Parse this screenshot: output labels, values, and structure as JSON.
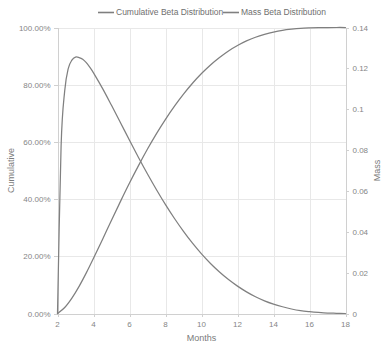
{
  "chart_data": {
    "type": "line",
    "title": "",
    "xlabel": "Months",
    "ylabel": "Cumulative",
    "y2label": "Mass",
    "xlim": [
      2,
      18
    ],
    "ylim": [
      0,
      1
    ],
    "y2lim": [
      0,
      0.14
    ],
    "grid": true,
    "legend_position": "top",
    "x_ticks": [
      2,
      4,
      6,
      8,
      10,
      12,
      14,
      16,
      18
    ],
    "x_tick_labels": [
      "2",
      "4",
      "6",
      "8",
      "10",
      "12",
      "14",
      "16",
      "18"
    ],
    "y_ticks": [
      0,
      0.2,
      0.4,
      0.6,
      0.8,
      1
    ],
    "y_tick_labels": [
      "0.00%",
      "20.00%",
      "40.00%",
      "60.00%",
      "80.00%",
      "100.00%"
    ],
    "y2_ticks": [
      0,
      0.02,
      0.04,
      0.06,
      0.08,
      0.1,
      0.12,
      0.14
    ],
    "y2_tick_labels": [
      "0",
      "0.02",
      "0.04",
      "0.06",
      "0.08",
      "0.1",
      "0.12",
      "0.14"
    ],
    "colors": {
      "cumulative": "#7f7f7f",
      "mass": "#808080",
      "grid": "#e8e8e8",
      "axis": "#d0d0d0",
      "text": "#868686"
    },
    "series": [
      {
        "name": "Cumulative Beta Distribution",
        "axis": "left",
        "color": "#7f7f7f",
        "x": [
          2,
          2.4,
          2.8,
          3.2,
          3.6,
          4,
          4.5,
          5,
          5.5,
          6,
          6.5,
          7,
          7.5,
          8,
          8.5,
          9,
          9.5,
          10,
          10.5,
          11,
          11.5,
          12,
          12.5,
          13,
          13.5,
          14,
          14.5,
          15,
          15.5,
          16,
          16.5,
          17,
          17.5,
          18
        ],
        "values": [
          0,
          0.021,
          0.054,
          0.095,
          0.142,
          0.193,
          0.259,
          0.326,
          0.392,
          0.456,
          0.517,
          0.575,
          0.629,
          0.679,
          0.725,
          0.767,
          0.805,
          0.839,
          0.869,
          0.895,
          0.918,
          0.937,
          0.953,
          0.966,
          0.976,
          0.984,
          0.99,
          0.994,
          0.997,
          0.9985,
          0.9994,
          0.9998,
          1,
          1
        ]
      },
      {
        "name": "Mass Beta Distribution",
        "axis": "right",
        "color": "#808080",
        "x": [
          2,
          2.2,
          2.4,
          2.6,
          2.8,
          3,
          3.2,
          3.4,
          3.6,
          3.8,
          4,
          4.5,
          5,
          5.5,
          6,
          6.5,
          7,
          7.5,
          8,
          8.5,
          9,
          9.5,
          10,
          10.5,
          11,
          11.5,
          12,
          12.5,
          13,
          13.5,
          14,
          14.5,
          15,
          15.5,
          16,
          16.5,
          17,
          17.5,
          18
        ],
        "values": [
          0,
          0.082,
          0.109,
          0.12,
          0.124,
          0.1255,
          0.1253,
          0.1245,
          0.1228,
          0.1205,
          0.1178,
          0.1102,
          0.1019,
          0.0934,
          0.0848,
          0.0764,
          0.0683,
          0.0606,
          0.0533,
          0.0465,
          0.0402,
          0.0344,
          0.0292,
          0.0245,
          0.0203,
          0.0166,
          0.0134,
          0.0106,
          0.0082,
          0.0062,
          0.0046,
          0.0033,
          0.0022,
          0.0014,
          0.0009,
          0.0005,
          0.0002,
          0.0001,
          0
        ]
      }
    ]
  },
  "legend": {
    "items": [
      {
        "label": "Cumulative Beta Distribution",
        "color": "#7f7f7f"
      },
      {
        "label": "Mass Beta Distribution",
        "color": "#808080"
      }
    ]
  }
}
